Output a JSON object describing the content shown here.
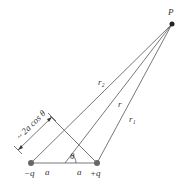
{
  "diagram": {
    "labels": {
      "point": "P",
      "r2": "r₂",
      "r": "r",
      "r1": "r₁",
      "path_diff": "~ 2a cos θ",
      "theta": "θ",
      "neg_charge": "−q",
      "pos_charge": "+q",
      "a_left": "a",
      "a_right": "a"
    },
    "colors": {
      "line": "#555555",
      "charge": "#666666",
      "text": "#333333"
    }
  }
}
